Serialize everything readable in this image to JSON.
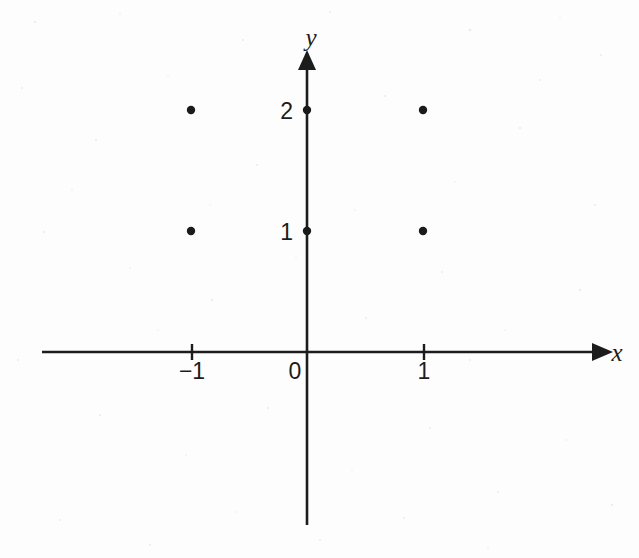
{
  "chart_data": {
    "type": "scatter",
    "title": "",
    "subtitle": "",
    "xlabel": "x",
    "ylabel": "y",
    "grid": false,
    "legend": null,
    "xlim": [
      -2.3,
      2.5
    ],
    "ylim": [
      -1.45,
      2.45
    ],
    "x_ticks": [
      {
        "value": -1,
        "label": "−1"
      },
      {
        "value": 0,
        "label": "0"
      },
      {
        "value": 1,
        "label": "1"
      }
    ],
    "y_ticks": [
      {
        "value": 1,
        "label": "1"
      },
      {
        "value": 2,
        "label": "2"
      }
    ],
    "points": [
      {
        "x": -1,
        "y": 2
      },
      {
        "x": 0,
        "y": 2
      },
      {
        "x": 1,
        "y": 2
      },
      {
        "x": -1,
        "y": 1
      },
      {
        "x": 0,
        "y": 1
      },
      {
        "x": 1,
        "y": 1
      }
    ],
    "marker": "filled-circle",
    "marker_color": "#1a1a1a",
    "axis_color": "#1c1c1c",
    "background_color": "#fdfdfd"
  },
  "axes": {
    "x_axis_label": "x",
    "y_axis_label": "y",
    "x_arrow": "arrow-right",
    "y_arrow": "arrow-up"
  },
  "tick_labels": {
    "x": [
      "−1",
      "0",
      "1"
    ],
    "y": [
      "1",
      "2"
    ]
  }
}
